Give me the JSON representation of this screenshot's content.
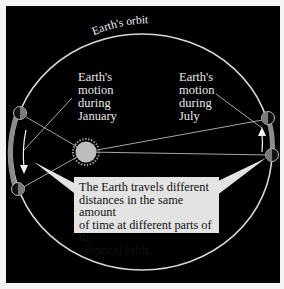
{
  "diagram": {
    "orbit_label": "Earth's orbit",
    "january_label": [
      "Earth's",
      "motion",
      "during",
      "January"
    ],
    "july_label": [
      "Earth's",
      "motion",
      "during",
      "July"
    ],
    "callout_text": [
      "The Earth travels different",
      "distances in the same amount",
      "of time at different parts of its",
      "elliptical orbit."
    ],
    "colors": {
      "background": "#000000",
      "orbit": "#d8d8d8",
      "sun": "#bdbdbd",
      "callout_bg": "#e3e3e3",
      "earth_arc": "#8a8a8a"
    }
  }
}
